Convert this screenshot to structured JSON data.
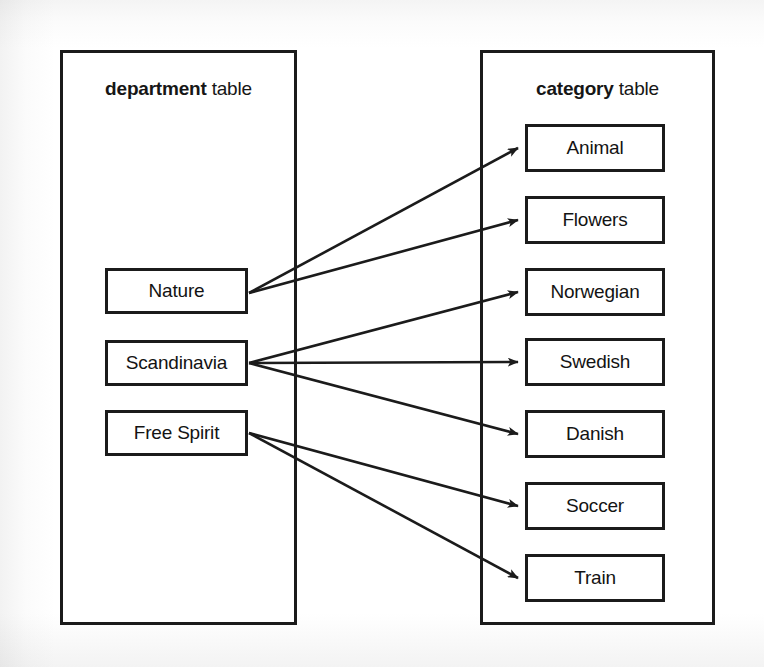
{
  "diagram": {
    "title_department": {
      "name": "department",
      "word": "table"
    },
    "title_category": {
      "name": "category",
      "word": "table"
    },
    "department_rows": [
      {
        "label": "Nature"
      },
      {
        "label": "Scandinavia"
      },
      {
        "label": "Free Spirit"
      }
    ],
    "category_rows": [
      {
        "label": "Animal"
      },
      {
        "label": "Flowers"
      },
      {
        "label": "Norwegian"
      },
      {
        "label": "Swedish"
      },
      {
        "label": "Danish"
      },
      {
        "label": "Soccer"
      },
      {
        "label": "Train"
      }
    ],
    "relationships": [
      {
        "from": "Nature",
        "to": "Animal"
      },
      {
        "from": "Nature",
        "to": "Flowers"
      },
      {
        "from": "Scandinavia",
        "to": "Norwegian"
      },
      {
        "from": "Scandinavia",
        "to": "Swedish"
      },
      {
        "from": "Scandinavia",
        "to": "Danish"
      },
      {
        "from": "Free Spirit",
        "to": "Soccer"
      },
      {
        "from": "Free Spirit",
        "to": "Train"
      }
    ],
    "colors": {
      "line": "#1b1b1b",
      "text": "#131313",
      "background": "#ffffff"
    }
  }
}
